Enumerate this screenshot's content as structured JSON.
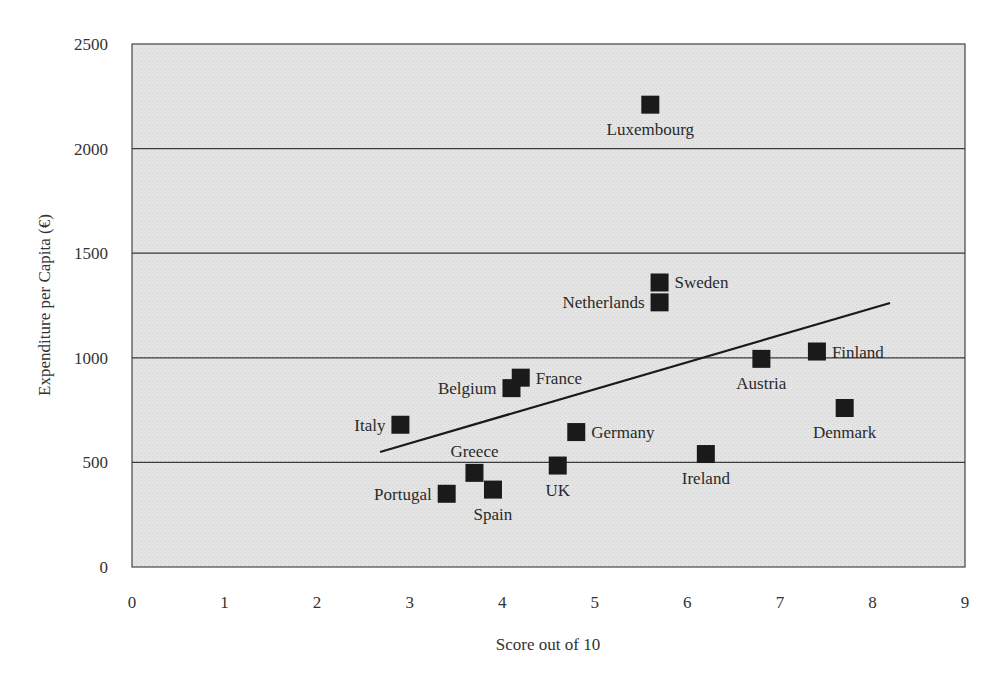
{
  "chart_data": {
    "type": "scatter",
    "title": "",
    "xlabel": "Score out of 10",
    "ylabel": "Expenditure per Capita (€)",
    "xlim": [
      0,
      9
    ],
    "ylim": [
      0,
      2500
    ],
    "x_ticks": [
      "0",
      "1",
      "2",
      "3",
      "4",
      "5",
      "6",
      "7",
      "8",
      "9"
    ],
    "y_ticks": [
      "0",
      "500",
      "1000",
      "1500",
      "2000",
      "2500"
    ],
    "grid": {
      "horizontal": true,
      "vertical": false
    },
    "legend": null,
    "background": "#e3e3e3",
    "marker_color": "#1a1a1a",
    "points": [
      {
        "label": "Luxembourg",
        "x": 5.6,
        "y": 2210,
        "label_pos": "below"
      },
      {
        "label": "Sweden",
        "x": 5.7,
        "y": 1360,
        "label_pos": "right"
      },
      {
        "label": "Netherlands",
        "x": 5.7,
        "y": 1265,
        "label_pos": "left"
      },
      {
        "label": "Finland",
        "x": 7.4,
        "y": 1030,
        "label_pos": "right"
      },
      {
        "label": "Austria",
        "x": 6.8,
        "y": 995,
        "label_pos": "below"
      },
      {
        "label": "France",
        "x": 4.2,
        "y": 905,
        "label_pos": "right"
      },
      {
        "label": "Belgium",
        "x": 4.1,
        "y": 855,
        "label_pos": "left"
      },
      {
        "label": "Denmark",
        "x": 7.7,
        "y": 760,
        "label_pos": "below"
      },
      {
        "label": "Italy",
        "x": 2.9,
        "y": 680,
        "label_pos": "left"
      },
      {
        "label": "Germany",
        "x": 4.8,
        "y": 645,
        "label_pos": "right"
      },
      {
        "label": "Ireland",
        "x": 6.2,
        "y": 540,
        "label_pos": "below"
      },
      {
        "label": "UK",
        "x": 4.6,
        "y": 485,
        "label_pos": "below"
      },
      {
        "label": "Greece",
        "x": 3.7,
        "y": 450,
        "label_pos": "above"
      },
      {
        "label": "Spain",
        "x": 3.9,
        "y": 370,
        "label_pos": "below"
      },
      {
        "label": "Portugal",
        "x": 3.4,
        "y": 350,
        "label_pos": "left"
      }
    ],
    "trend_line": {
      "x1": 2.68,
      "y1": 550,
      "x2": 8.19,
      "y2": 1262
    }
  }
}
